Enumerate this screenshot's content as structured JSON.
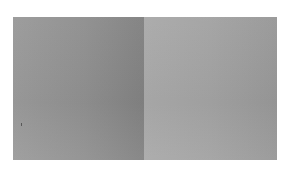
{
  "figure": {
    "panels": [
      {
        "name": "left",
        "tone": "#8f8f8f"
      },
      {
        "name": "right",
        "tone": "#a2a2a2"
      }
    ]
  }
}
